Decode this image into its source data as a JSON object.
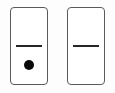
{
  "board": {
    "background_color": "#fdfdfd",
    "tile_count": 2,
    "label": "domino-board"
  },
  "style": {
    "tile_fill": "#ffffff",
    "tile_border_color": "#5a5a5a",
    "divider_color": "#262626",
    "pip_color": "#0a0a0a"
  },
  "tiles": [
    {
      "name": "domino-tile-blank-one",
      "position": "left",
      "top_half": {
        "value": 0,
        "value_label": "0",
        "pips": []
      },
      "bottom_half": {
        "value": 1,
        "value_label": "1",
        "pips": [
          {
            "name": "pip-center",
            "position": "center"
          }
        ]
      },
      "notation": "0-1"
    },
    {
      "name": "domino-tile-double-blank",
      "position": "right",
      "top_half": {
        "value": 0,
        "value_label": "0",
        "pips": []
      },
      "bottom_half": {
        "value": 0,
        "value_label": "0",
        "pips": []
      },
      "notation": "0-0"
    }
  ]
}
